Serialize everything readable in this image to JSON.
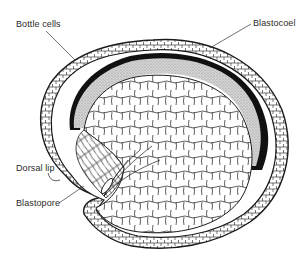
{
  "diagram": {
    "labels": {
      "bottle_cells": "Bottle cells",
      "blastocoel": "Blastocoel",
      "dorsal_lip": "Dorsal lip",
      "blastopore": "Blastopore"
    },
    "colors": {
      "line": "#1a1a1a",
      "blastocoel_fill": "#c8c8c8",
      "dark_band": "#111111",
      "background": "#ffffff",
      "label_text": "#2a2a2a"
    }
  }
}
